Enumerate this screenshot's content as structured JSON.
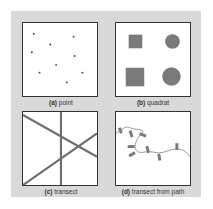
{
  "colors": {
    "background": "#d9d9d9",
    "panel": "#ffffff",
    "shape_fill": "#7a7a7a",
    "line": "#6e6e6e",
    "text": "#333333"
  },
  "panels": [
    {
      "id": "a",
      "letter": "(a)",
      "title": "point"
    },
    {
      "id": "b",
      "letter": "(b)",
      "title": "quadrat"
    },
    {
      "id": "c",
      "letter": "(c)",
      "title": "transect"
    },
    {
      "id": "d",
      "letter": "(d)",
      "title": "transect from path"
    }
  ]
}
